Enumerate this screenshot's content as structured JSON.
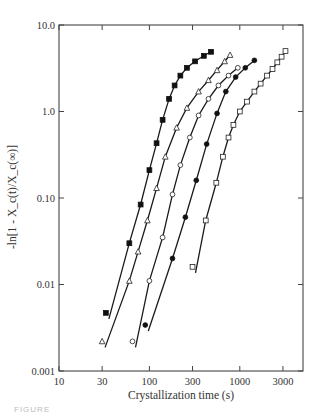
{
  "chart_data": {
    "type": "scatter",
    "title": "",
    "xlabel": "Crystallization time (s)",
    "ylabel": "-ln[1 - X_c(t)/X_c(∞)]",
    "x_scale": "log",
    "y_scale": "log",
    "xlim": [
      10,
      5000
    ],
    "ylim": [
      0.001,
      10.0
    ],
    "x_ticks": [
      10,
      30,
      100,
      300,
      1000,
      3000
    ],
    "x_tick_labels": [
      "10",
      "30",
      "100",
      "300",
      "1000",
      "3000"
    ],
    "y_ticks": [
      0.001,
      0.01,
      0.1,
      1.0,
      10.0
    ],
    "y_tick_labels": [
      "0.001",
      "0.01",
      "0.10",
      "1.0",
      "10.0"
    ],
    "grid": false,
    "legend": null,
    "series": [
      {
        "name": "filled squares",
        "marker": "square-filled",
        "x": [
          33,
          60,
          80,
          100,
          120,
          140,
          165,
          190,
          220,
          260,
          320,
          400,
          480
        ],
        "y": [
          0.0047,
          0.03,
          0.084,
          0.21,
          0.43,
          0.8,
          1.4,
          2.0,
          2.6,
          3.2,
          3.8,
          4.4,
          4.9
        ]
      },
      {
        "name": "open triangles",
        "marker": "triangle-open",
        "x": [
          30,
          60,
          75,
          95,
          120,
          150,
          200,
          260,
          350,
          450,
          560,
          680,
          780
        ],
        "y": [
          0.0022,
          0.011,
          0.024,
          0.055,
          0.13,
          0.3,
          0.65,
          1.1,
          1.7,
          2.3,
          3.0,
          3.8,
          4.5
        ]
      },
      {
        "name": "open circles",
        "marker": "circle-open",
        "x": [
          65,
          100,
          140,
          180,
          220,
          280,
          350,
          450,
          580,
          750,
          950
        ],
        "y": [
          0.0022,
          0.011,
          0.035,
          0.11,
          0.24,
          0.5,
          0.9,
          1.4,
          2.0,
          2.6,
          3.2
        ]
      },
      {
        "name": "filled circles",
        "marker": "circle-filled",
        "x": [
          90,
          180,
          250,
          330,
          430,
          560,
          700,
          900,
          1150,
          1450
        ],
        "y": [
          0.0034,
          0.02,
          0.06,
          0.16,
          0.42,
          0.95,
          1.7,
          2.5,
          3.2,
          3.9
        ]
      },
      {
        "name": "open squares",
        "marker": "square-open",
        "x": [
          300,
          420,
          550,
          650,
          750,
          850,
          1000,
          1200,
          1450,
          1700,
          2000,
          2300,
          2600,
          2900,
          3200
        ],
        "y": [
          0.016,
          0.055,
          0.15,
          0.3,
          0.5,
          0.7,
          1.0,
          1.3,
          1.7,
          2.1,
          2.6,
          3.1,
          3.7,
          4.3,
          5.0
        ]
      }
    ]
  },
  "caption": "FIGURE"
}
